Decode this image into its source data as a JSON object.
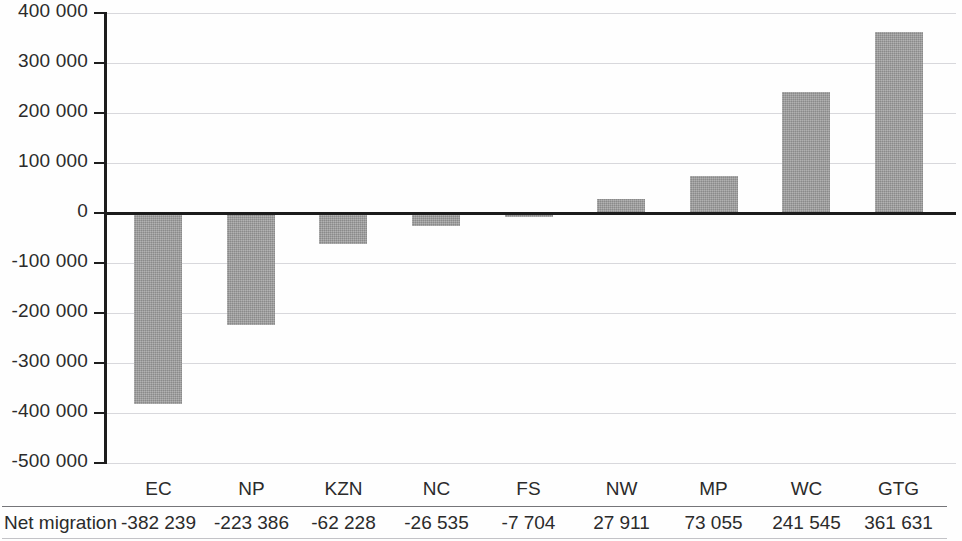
{
  "chart_data": {
    "type": "bar",
    "title": "",
    "subtitle": "",
    "xlabel": "",
    "ylabel": "",
    "categories": [
      "EC",
      "NP",
      "KZN",
      "NC",
      "FS",
      "NW",
      "MP",
      "WC",
      "GTG"
    ],
    "values": [
      -382239,
      -223386,
      -62228,
      -26535,
      -7704,
      27911,
      73055,
      241545,
      361631
    ],
    "value_labels": [
      "-382 239",
      "-223 386",
      "-62 228",
      "-26 535",
      "-7 704",
      "27 911",
      "73 055",
      "241 545",
      "361 631"
    ],
    "series": [
      {
        "name": "Net migration",
        "values": [
          -382239,
          -223386,
          -62228,
          -26535,
          -7704,
          27911,
          73055,
          241545,
          361631
        ]
      }
    ],
    "ylim": [
      -500000,
      400000
    ],
    "yticks": [
      400000,
      300000,
      200000,
      100000,
      0,
      -100000,
      -200000,
      -300000,
      -400000,
      -500000
    ],
    "ytick_labels": [
      "400 000",
      "300 000",
      "200 000",
      "100 000",
      "0",
      "-100 000",
      "-200 000",
      "-300 000",
      "-400 000",
      "-500 000"
    ],
    "grid": true,
    "legend": "none",
    "bar_color": "#9d9d9d",
    "zero_line_color": "#1c1c1c",
    "gridline_color": "#d8d8dc",
    "axis_color": "#1d1d1d"
  },
  "table": {
    "row_label": "Net migration",
    "headers": [
      "EC",
      "NP",
      "KZN",
      "NC",
      "FS",
      "NW",
      "MP",
      "WC",
      "GTG"
    ],
    "values": [
      "-382 239",
      "-223 386",
      "-62 228",
      "-26 535",
      "-7 704",
      "27 911",
      "73 055",
      "241 545",
      "361 631"
    ]
  }
}
